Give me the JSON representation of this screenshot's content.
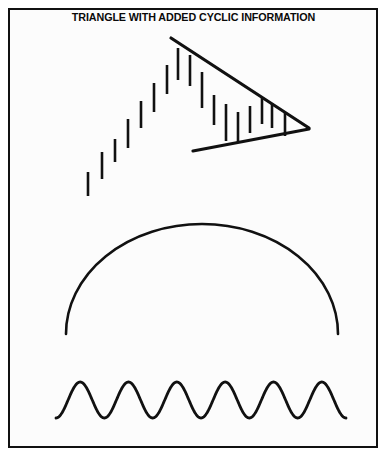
{
  "figure": {
    "title": "TRIANGLE WITH ADDED CYCLIC INFORMATION",
    "background_color": "#fcfcfc",
    "page_color": "#ffffff",
    "ink_color": "#111111",
    "border_color": "#111111",
    "border_width_px": 2,
    "frame": {
      "x": 8,
      "y": 8,
      "width": 370,
      "height": 440
    }
  },
  "chart_data": {
    "type": "line",
    "title": "TRIANGLE WITH ADDED CYCLIC INFORMATION",
    "xlabel": "",
    "ylabel": "",
    "xlim": [
      0,
      387
    ],
    "ylim": [
      457,
      0
    ],
    "grid": false,
    "legend": null,
    "annotations": [],
    "panels": [
      {
        "name": "price-bars-triangle",
        "description": "Vertical price bars rising into a converging symmetrical-triangle consolidation",
        "series": [
          {
            "name": "price-bars",
            "type": "bar-range",
            "bars": [
              {
                "x": 88,
                "y_top": 172,
                "y_bottom": 196
              },
              {
                "x": 102,
                "y_top": 152,
                "y_bottom": 179
              },
              {
                "x": 115,
                "y_top": 139,
                "y_bottom": 162
              },
              {
                "x": 128,
                "y_top": 119,
                "y_bottom": 148
              },
              {
                "x": 141,
                "y_top": 101,
                "y_bottom": 128
              },
              {
                "x": 154,
                "y_top": 83,
                "y_bottom": 112
              },
              {
                "x": 167,
                "y_top": 65,
                "y_bottom": 94
              },
              {
                "x": 178,
                "y_top": 48,
                "y_bottom": 80
              },
              {
                "x": 190,
                "y_top": 55,
                "y_bottom": 86
              },
              {
                "x": 202,
                "y_top": 72,
                "y_bottom": 108
              },
              {
                "x": 214,
                "y_top": 95,
                "y_bottom": 125
              },
              {
                "x": 226,
                "y_top": 104,
                "y_bottom": 141
              },
              {
                "x": 238,
                "y_top": 112,
                "y_bottom": 142
              },
              {
                "x": 250,
                "y_top": 106,
                "y_bottom": 133
              },
              {
                "x": 262,
                "y_top": 98,
                "y_bottom": 124
              },
              {
                "x": 272,
                "y_top": 103,
                "y_bottom": 128
              },
              {
                "x": 285,
                "y_top": 112,
                "y_bottom": 136
              }
            ]
          },
          {
            "name": "upper-trendline",
            "type": "line",
            "points": [
              {
                "x": 171,
                "y": 38
              },
              {
                "x": 309,
                "y": 128
              }
            ]
          },
          {
            "name": "lower-trendline",
            "type": "line",
            "points": [
              {
                "x": 193,
                "y": 151
              },
              {
                "x": 309,
                "y": 129
              }
            ]
          }
        ]
      },
      {
        "name": "arc-curve",
        "description": "Large smooth dome / semicircular arc",
        "series": [
          {
            "name": "dome-arc",
            "type": "arc",
            "center_x": 202,
            "peak_y": 224,
            "left_end": {
              "x": 66,
              "y": 334
            },
            "right_end": {
              "x": 338,
              "y": 334
            }
          }
        ]
      },
      {
        "name": "cyclic-wave",
        "description": "Regular sinusoidal cycle wave with six oscillations",
        "series": [
          {
            "name": "sine-wave",
            "type": "sine",
            "x_start": 56,
            "x_end": 346,
            "baseline_y": 400,
            "amplitude": 18,
            "cycles": 6
          }
        ]
      }
    ]
  }
}
